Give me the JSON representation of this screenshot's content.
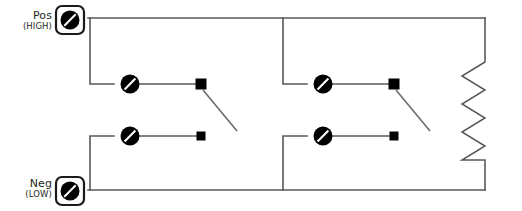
{
  "diagram": {
    "type": "electrical-schematic",
    "background_color": "#ffffff",
    "wire_color": "#58585a",
    "symbol_color": "#000000",
    "label_color": "#231f20"
  },
  "terminals": [
    {
      "id": "pos",
      "label": "Pos",
      "sublabel": "(HIGH)",
      "icon": "connector-slash-icon",
      "x": 70,
      "y": 20
    },
    {
      "id": "neg",
      "label": "Neg",
      "sublabel": "(LOW)",
      "icon": "connector-slash-icon",
      "x": 70,
      "y": 191
    }
  ],
  "switches": [
    {
      "id": "switch-1",
      "branch": "left",
      "row": "upper",
      "state": "open",
      "disc_x": 130,
      "disc_y": 84,
      "square_x": 201,
      "square_y": 84,
      "arm_end_x": 237,
      "arm_end_y": 131
    },
    {
      "id": "switch-2",
      "branch": "left",
      "row": "lower",
      "state": "open",
      "disc_x": 130,
      "disc_y": 136,
      "square_x": 201,
      "square_y": 136,
      "arm_end_x": 237,
      "arm_end_y": 131
    },
    {
      "id": "switch-3",
      "branch": "right",
      "row": "upper",
      "state": "open",
      "disc_x": 323,
      "disc_y": 84,
      "square_x": 394,
      "square_y": 84,
      "arm_end_x": 430,
      "arm_end_y": 131
    },
    {
      "id": "switch-4",
      "branch": "right",
      "row": "lower",
      "state": "open",
      "disc_x": 323,
      "disc_y": 136,
      "square_x": 394,
      "square_y": 136,
      "arm_end_x": 430,
      "arm_end_y": 131
    }
  ],
  "resistor": {
    "id": "resistor-1",
    "orientation": "vertical",
    "x": 485,
    "top_y": 57,
    "bottom_y": 165,
    "zigzag_peaks": 4,
    "amplitude": 22
  },
  "rails": {
    "top_y": 18,
    "bottom_y": 190,
    "left_x": 88,
    "right_x": 485,
    "branch_left_x": 90,
    "branch_right_x": 283,
    "upper_row_y": 84,
    "lower_row_y": 136
  }
}
